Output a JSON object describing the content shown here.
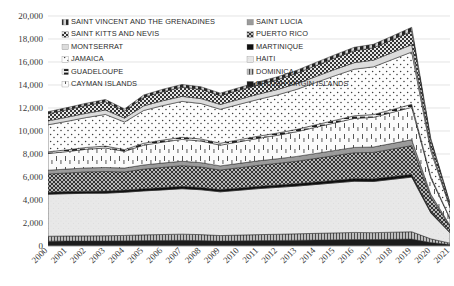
{
  "chart_data": {
    "type": "area",
    "stacked": true,
    "title": "",
    "subtitle": "",
    "xlabel": "",
    "ylabel": "",
    "grid": true,
    "legend_position": "top-inside",
    "ylim": [
      0,
      20000
    ],
    "ytick_step": 2000,
    "ytick_labels": [
      "0",
      "2,000",
      "4,000",
      "6,000",
      "8,000",
      "10,000",
      "12,000",
      "14,000",
      "16,000",
      "18,000",
      "20,000"
    ],
    "ytick_values": [
      0,
      2000,
      4000,
      6000,
      8000,
      10000,
      12000,
      14000,
      16000,
      18000,
      20000
    ],
    "categories": [
      "2000",
      "2001",
      "2002",
      "2003",
      "2004",
      "2005",
      "2006",
      "2007",
      "2008",
      "2009",
      "2010",
      "2011",
      "2012",
      "2013",
      "2014",
      "2015",
      "2016",
      "2017",
      "2018",
      "2019",
      "2020",
      "2021"
    ],
    "x": [
      2000,
      2001,
      2002,
      2003,
      2004,
      2005,
      2006,
      2007,
      2008,
      2009,
      2010,
      2011,
      2012,
      2013,
      2014,
      2015,
      2016,
      2017,
      2018,
      2019,
      2020,
      2021
    ],
    "series": [
      {
        "name": "BRITISH VIRGIN ISLANDS",
        "pattern": "solid-dark",
        "fill": "#1a1a1a",
        "values": [
          420,
          430,
          430,
          440,
          450,
          470,
          480,
          490,
          470,
          430,
          450,
          470,
          480,
          500,
          520,
          540,
          560,
          560,
          580,
          600,
          300,
          120
        ]
      },
      {
        "name": "DOMINICA",
        "pattern": "vertical-thin",
        "fill": "#8a8a8a",
        "values": [
          430,
          440,
          450,
          450,
          470,
          500,
          520,
          540,
          520,
          480,
          500,
          520,
          540,
          560,
          580,
          600,
          620,
          600,
          620,
          640,
          320,
          130
        ]
      },
      {
        "name": "HAITI",
        "pattern": "light-sparse",
        "fill": "#e4e4e4",
        "values": [
          3650,
          3680,
          3700,
          3700,
          3750,
          3820,
          3880,
          3950,
          3900,
          3800,
          3900,
          4000,
          4080,
          4150,
          4250,
          4350,
          4450,
          4450,
          4600,
          4750,
          2250,
          900
        ]
      },
      {
        "name": "MARTINIQUE",
        "pattern": "solid-black-thin",
        "fill": "#111111",
        "values": [
          180,
          180,
          185,
          185,
          190,
          195,
          200,
          205,
          200,
          195,
          200,
          205,
          210,
          215,
          220,
          225,
          230,
          230,
          235,
          240,
          120,
          50
        ]
      },
      {
        "name": "PUERTO RICO",
        "pattern": "diagonal-crosshatch",
        "fill": "#5a5a5a",
        "values": [
          1580,
          1620,
          1680,
          1700,
          1580,
          1700,
          1760,
          1800,
          1780,
          1700,
          1760,
          1820,
          1880,
          1950,
          2050,
          2150,
          2250,
          2300,
          2400,
          2500,
          1250,
          500
        ]
      },
      {
        "name": "SAINT LUCIA",
        "pattern": "gray-band",
        "fill": "#9e9e9e",
        "values": [
          330,
          340,
          345,
          350,
          340,
          360,
          375,
          385,
          375,
          360,
          375,
          390,
          400,
          415,
          430,
          445,
          460,
          470,
          490,
          510,
          255,
          100
        ]
      },
      {
        "name": "CAYMAN ISLANDS",
        "pattern": "sparse-dot-tall",
        "fill": "#f2f2f2",
        "values": [
          1450,
          1520,
          1620,
          1700,
          1450,
          1720,
          1820,
          1900,
          1880,
          1800,
          1880,
          1960,
          2040,
          2150,
          2280,
          2400,
          2520,
          2580,
          2700,
          2820,
          1400,
          560
        ]
      },
      {
        "name": "GUADELOUPE",
        "pattern": "dashed-line",
        "fill": "#2a2a2a",
        "values": [
          150,
          155,
          160,
          165,
          150,
          170,
          178,
          185,
          182,
          175,
          182,
          190,
          198,
          205,
          215,
          225,
          235,
          240,
          250,
          262,
          130,
          52
        ]
      },
      {
        "name": "JAMAICA",
        "pattern": "fine-dot",
        "fill": "#fafafa",
        "values": [
          2350,
          2480,
          2600,
          2750,
          2400,
          2850,
          3000,
          3120,
          3080,
          2950,
          3080,
          3200,
          3320,
          3480,
          3680,
          3880,
          4050,
          4150,
          4350,
          4550,
          2250,
          900
        ]
      },
      {
        "name": "MONTSERRAT",
        "pattern": "light-gray-band",
        "fill": "#d6d6d6",
        "values": [
          340,
          355,
          370,
          385,
          340,
          400,
          420,
          435,
          430,
          415,
          430,
          450,
          465,
          490,
          515,
          540,
          565,
          580,
          605,
          635,
          315,
          125
        ]
      },
      {
        "name": "SAINT KITTS AND NEVIS",
        "pattern": "checker-dark",
        "fill": "#3d3d3d",
        "values": [
          620,
          650,
          680,
          710,
          620,
          735,
          775,
          805,
          795,
          765,
          795,
          830,
          860,
          905,
          950,
          995,
          1040,
          1070,
          1115,
          1170,
          580,
          235
        ]
      },
      {
        "name": "SAINT VINCENT AND THE GRENADINES",
        "pattern": "dash-dot-top",
        "fill": "#1f1f1f",
        "values": [
          180,
          185,
          195,
          205,
          180,
          212,
          222,
          232,
          228,
          220,
          228,
          238,
          248,
          260,
          275,
          288,
          300,
          308,
          322,
          338,
          168,
          68
        ]
      }
    ],
    "totals": [
      11680,
      11938,
      12215,
      12540,
      11920,
      12732,
      13230,
      13647,
      13540,
      13090,
      13580,
      14073,
      14520,
      15180,
      15963,
      16638,
      17280,
      17538,
      18267,
      19015,
      9338,
      3740
    ],
    "annotations": []
  },
  "legend": {
    "left_column": [
      {
        "label": "SAINT VINCENT AND THE GRENADINES",
        "marker": "dash-dot-top"
      },
      {
        "label": "SAINT KITTS AND NEVIS",
        "marker": "checker-dark"
      },
      {
        "label": "MONTSERRAT",
        "marker": "light-gray-band"
      },
      {
        "label": "JAMAICA",
        "marker": "fine-dot"
      },
      {
        "label": "GUADELOUPE",
        "marker": "dashed-line"
      },
      {
        "label": "CAYMAN ISLANDS",
        "marker": "sparse-dot-tall"
      }
    ],
    "right_column": [
      {
        "label": "SAINT LUCIA",
        "marker": "gray-band"
      },
      {
        "label": "PUERTO RICO",
        "marker": "diagonal-crosshatch"
      },
      {
        "label": "MARTINIQUE",
        "marker": "solid-black-thin"
      },
      {
        "label": "HAITI",
        "marker": "light-sparse"
      },
      {
        "label": "DOMINICA",
        "marker": "vertical-thin"
      },
      {
        "label": "BRITISH VIRGIN ISLANDS",
        "marker": "solid-dark"
      }
    ]
  },
  "colors": {
    "grid": "#d9d9d9",
    "axis": "#9a9a9a",
    "text": "#3a3a3a",
    "background": "#ffffff"
  }
}
